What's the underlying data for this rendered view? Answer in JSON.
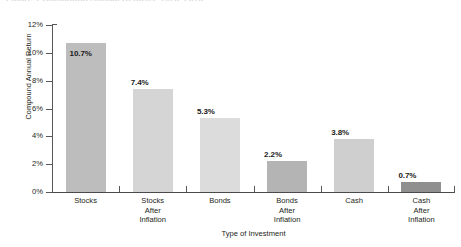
{
  "figure": {
    "caption_cutoff": "Figure 1  Compound Annual Returns, 1926–2013"
  },
  "chart_data": {
    "type": "bar",
    "title": "",
    "xlabel": "Type of Investment",
    "ylabel": "Compound Annual Return",
    "categories": [
      "Stocks",
      "Stocks\nAfter\nInflation",
      "Bonds",
      "Bonds\nAfter\nInflation",
      "Cash",
      "Cash\nAfter\nInflation"
    ],
    "values": [
      10.7,
      7.4,
      5.3,
      2.2,
      3.8,
      0.7
    ],
    "value_labels": [
      "10.7%",
      "7.4%",
      "5.3%",
      "2.2%",
      "3.8%",
      "0.7%"
    ],
    "bar_colors": [
      "#bdbdbd",
      "#d5d5d5",
      "#dcdcdc",
      "#b4b4b4",
      "#cfcfcf",
      "#8f8f8f"
    ],
    "ylim": [
      0,
      12
    ],
    "ytick_labels": [
      "0%",
      "2%",
      "4%",
      "6%",
      "8%",
      "10%",
      "12%"
    ],
    "ytick_values": [
      0,
      2,
      4,
      6,
      8,
      10,
      12
    ],
    "grid": false,
    "legend": "none"
  },
  "colors": {
    "axis": "#58585b",
    "text": "#231f20",
    "background": "#ffffff"
  }
}
